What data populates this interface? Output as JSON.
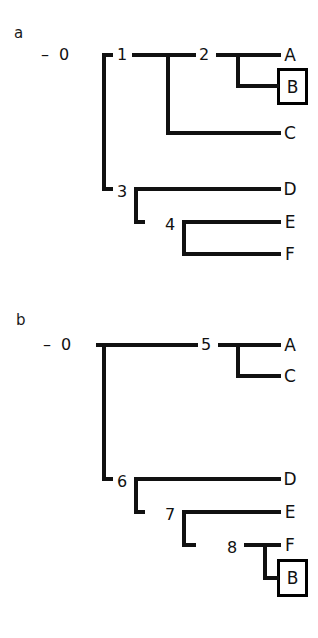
{
  "figure": {
    "type": "cladogram-pair",
    "background_color": "#ffffff",
    "line_color": "#111111",
    "box_border_color": "#000000"
  },
  "panels": [
    {
      "id": "a",
      "label": "a",
      "root_dash": "–",
      "internal_nodes": [
        {
          "name": "0",
          "label": "0"
        },
        {
          "name": "1",
          "label": "1"
        },
        {
          "name": "2",
          "label": "2"
        },
        {
          "name": "3",
          "label": "3"
        },
        {
          "name": "4",
          "label": "4"
        }
      ],
      "leaves": [
        {
          "name": "A",
          "label": "A",
          "boxed": false
        },
        {
          "name": "B",
          "label": "B",
          "boxed": true
        },
        {
          "name": "C",
          "label": "C",
          "boxed": false
        },
        {
          "name": "D",
          "label": "D",
          "boxed": false
        },
        {
          "name": "E",
          "label": "E",
          "boxed": false
        },
        {
          "name": "F",
          "label": "F",
          "boxed": false
        }
      ],
      "topology": "0 -> (1 -> (2 -> (A, B), C), 3 -> (D, 4 -> (E, F)))"
    },
    {
      "id": "b",
      "label": "b",
      "root_dash": "–",
      "internal_nodes": [
        {
          "name": "0",
          "label": "0"
        },
        {
          "name": "5",
          "label": "5"
        },
        {
          "name": "6",
          "label": "6"
        },
        {
          "name": "7",
          "label": "7"
        },
        {
          "name": "8",
          "label": "8"
        }
      ],
      "leaves": [
        {
          "name": "A",
          "label": "A",
          "boxed": false
        },
        {
          "name": "C",
          "label": "C",
          "boxed": false
        },
        {
          "name": "D",
          "label": "D",
          "boxed": false
        },
        {
          "name": "E",
          "label": "E",
          "boxed": false
        },
        {
          "name": "F",
          "label": "F",
          "boxed": false
        },
        {
          "name": "B",
          "label": "B",
          "boxed": true
        }
      ],
      "topology": "0 -> (5 -> (A, C), 6 -> (D, 7 -> (E, 8 -> (F, B))))"
    }
  ]
}
